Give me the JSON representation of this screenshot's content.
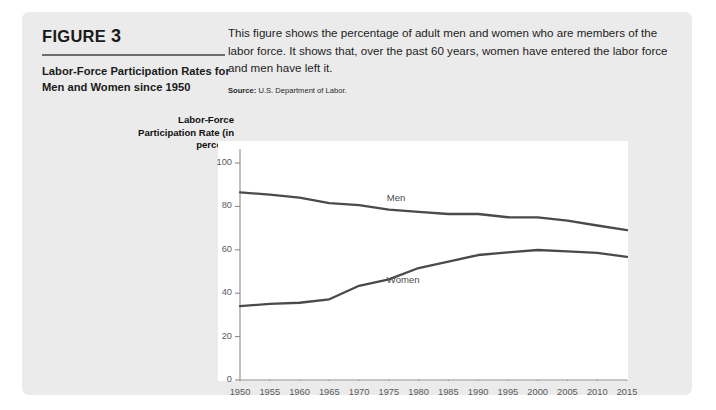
{
  "figure": {
    "label_prefix": "FIGURE",
    "label_number": "3",
    "subtitle": "Labor-Force Participation Rates for Men and Women since 1950",
    "description": "This figure shows the percentage of adult men and women who are members of the labor force. It shows that, over the past 60 years, women have entered the labor force and men have left it.",
    "source_label": "Source:",
    "source_text": "U.S. Department of Labor."
  },
  "colors": {
    "card_background": "#ebebeb",
    "plot_background": "#ffffff",
    "line": "#4a4a4a",
    "axis": "#8c8c8c",
    "tick_text": "#5b5b5b",
    "title_text": "#1a1a1a"
  },
  "chart_data": {
    "type": "line",
    "title": "Labor-Force Participation Rates for Men and Women since 1950",
    "xlabel": "",
    "ylabel": "Labor-Force Participation Rate (in percent)",
    "xlim": [
      1950,
      2015
    ],
    "ylim": [
      0,
      100
    ],
    "grid": false,
    "legend": "inline-labels",
    "xticks": [
      1950,
      1955,
      1960,
      1965,
      1970,
      1975,
      1980,
      1985,
      1990,
      1995,
      2000,
      2005,
      2010,
      2015
    ],
    "yticks": [
      0,
      20,
      40,
      60,
      80,
      100
    ],
    "x": [
      1950,
      1955,
      1960,
      1965,
      1970,
      1975,
      1980,
      1985,
      1990,
      1995,
      2000,
      2005,
      2010,
      2015
    ],
    "series": [
      {
        "name": "Men",
        "label_x": 1977,
        "label_y": 84,
        "values": [
          86.5,
          85.4,
          84.0,
          81.5,
          80.6,
          78.5,
          77.5,
          76.5,
          76.5,
          75.0,
          74.9,
          73.4,
          71.2,
          69.1
        ]
      },
      {
        "name": "Women",
        "label_x": 1977,
        "label_y": 46,
        "values": [
          34.0,
          35.1,
          35.6,
          37.2,
          43.4,
          46.4,
          51.6,
          54.6,
          57.6,
          58.8,
          59.9,
          59.3,
          58.6,
          56.7
        ]
      }
    ]
  }
}
